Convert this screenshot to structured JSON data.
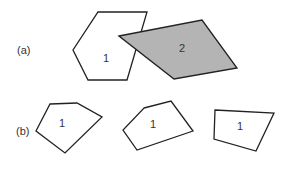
{
  "figure": {
    "part_a": {
      "label": "(a)",
      "polygons": [
        {
          "id": "hexagon",
          "label": "1",
          "fill": "#ffffff"
        },
        {
          "id": "parallelogram",
          "label": "2",
          "fill": "#b4b4b4"
        }
      ]
    },
    "part_b": {
      "label": "(b)",
      "polygons": [
        {
          "id": "pentagon-left",
          "label": "1"
        },
        {
          "id": "pentagon-middle",
          "label": "1"
        },
        {
          "id": "quadrilateral-right",
          "label": "1"
        }
      ]
    },
    "stroke_color": "#222222"
  }
}
